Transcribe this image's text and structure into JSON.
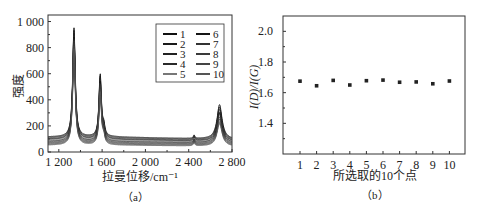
{
  "chart_data": [
    {
      "panel": "(a)",
      "type": "line",
      "xlabel": "拉曼位移/cm⁻¹",
      "ylabel": "强度",
      "xlim": [
        1100,
        2800
      ],
      "ylim": [
        0,
        1050
      ],
      "xticks": [
        1200,
        1600,
        2000,
        2400,
        2800
      ],
      "xtick_labels": [
        "1 200",
        "1 600",
        "2 000",
        "2 400",
        "2 800"
      ],
      "yticks": [
        0,
        200,
        400,
        600,
        800,
        1000
      ],
      "ytick_labels": [
        "0",
        "200",
        "400",
        "600",
        "800",
        "1 000"
      ],
      "grid": false,
      "legend_position": "upper right",
      "legend": [
        "1",
        "2",
        "3",
        "4",
        "5",
        "6",
        "7",
        "8",
        "9",
        "10"
      ],
      "peaks": [
        {
          "name": "D",
          "x": 1340,
          "max_intensity": 950,
          "min_intensity": 780
        },
        {
          "name": "G",
          "x": 1580,
          "max_intensity": 590,
          "min_intensity": 450
        },
        {
          "name": "2D",
          "x": 2680,
          "max_intensity": 380,
          "min_intensity": 220
        }
      ],
      "baseline_range": [
        50,
        120
      ],
      "series": [
        {
          "name": "1",
          "d": 950,
          "g": 590,
          "d2": 380,
          "base": 115
        },
        {
          "name": "2",
          "d": 930,
          "g": 575,
          "d2": 360,
          "base": 108
        },
        {
          "name": "3",
          "d": 910,
          "g": 560,
          "d2": 340,
          "base": 100
        },
        {
          "name": "4",
          "d": 890,
          "g": 545,
          "d2": 320,
          "base": 95
        },
        {
          "name": "5",
          "d": 860,
          "g": 520,
          "d2": 300,
          "base": 88
        },
        {
          "name": "6",
          "d": 880,
          "g": 535,
          "d2": 310,
          "base": 80
        },
        {
          "name": "7",
          "d": 850,
          "g": 510,
          "d2": 280,
          "base": 72
        },
        {
          "name": "8",
          "d": 830,
          "g": 495,
          "d2": 260,
          "base": 65
        },
        {
          "name": "9",
          "d": 810,
          "g": 475,
          "d2": 240,
          "base": 58
        },
        {
          "name": "10",
          "d": 790,
          "g": 455,
          "d2": 225,
          "base": 52
        }
      ]
    },
    {
      "panel": "(b)",
      "type": "scatter",
      "xlabel": "所选取的10个点",
      "ylabel": "I(D)/I(G)",
      "x": [
        1,
        2,
        3,
        4,
        5,
        6,
        7,
        8,
        9,
        10
      ],
      "values": [
        1.675,
        1.645,
        1.68,
        1.65,
        1.678,
        1.682,
        1.668,
        1.67,
        1.658,
        1.676
      ],
      "xlim": [
        0,
        11
      ],
      "ylim": [
        1.2,
        2.1
      ],
      "yticks": [
        1.4,
        1.6,
        1.8,
        2.0
      ],
      "ytick_labels": [
        "1.4",
        "1.6",
        "1.8",
        "2.0"
      ],
      "xtick_labels": [
        "1",
        "2",
        "3",
        "4",
        "5",
        "6",
        "7",
        "8",
        "9",
        "10"
      ],
      "grid": false
    }
  ],
  "captions": {
    "a": "（a）",
    "b": "（b）"
  }
}
